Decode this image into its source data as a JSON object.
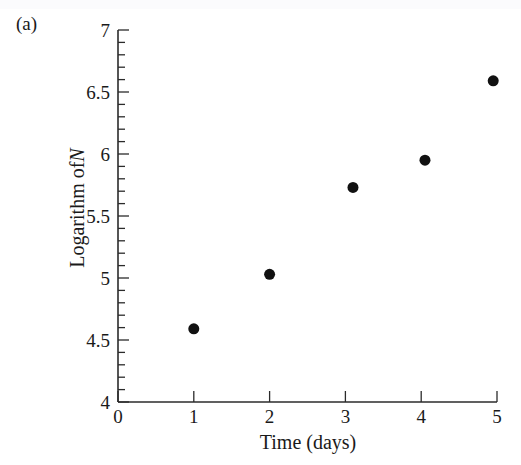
{
  "figure": {
    "panel_label": "(a)",
    "background_color": "#ffffff",
    "foreground_color": "#1a1a1a"
  },
  "chart_data": {
    "type": "scatter",
    "title": "",
    "panel": "(a)",
    "xlabel": "Time (days)",
    "ylabel": "Logarithm of N",
    "ylabel_plain": "Logarithm of",
    "ylabel_italic": "N",
    "xlim": [
      0,
      5
    ],
    "ylim": [
      4,
      7
    ],
    "xticks": [
      0,
      1,
      2,
      3,
      4,
      5
    ],
    "xtick_labels": [
      "0",
      "1",
      "2",
      "3",
      "4",
      "5"
    ],
    "yticks": [
      4,
      4.5,
      5,
      5.5,
      6,
      6.5,
      7
    ],
    "ytick_labels": [
      "4",
      "4.5",
      "5",
      "5.5",
      "6",
      "6.5",
      "7"
    ],
    "y_minor_step": 0.1,
    "x_minor_ticks": false,
    "grid": false,
    "legend": null,
    "marker": "filled-circle",
    "marker_color": "#111111",
    "marker_size": 11,
    "x": [
      1.0,
      2.0,
      3.1,
      4.05,
      4.95
    ],
    "y": [
      4.59,
      5.03,
      5.73,
      5.95,
      6.59
    ],
    "points": [
      {
        "x": 1.0,
        "y": 4.59
      },
      {
        "x": 2.0,
        "y": 5.03
      },
      {
        "x": 3.1,
        "y": 5.73
      },
      {
        "x": 4.05,
        "y": 5.95
      },
      {
        "x": 4.95,
        "y": 6.59
      }
    ]
  }
}
